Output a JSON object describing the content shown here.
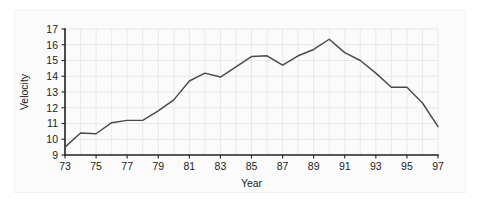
{
  "chart_data": {
    "type": "line",
    "title": "",
    "xlabel": "Year",
    "ylabel": "Velocity",
    "xlim": [
      73,
      97
    ],
    "ylim": [
      9,
      17
    ],
    "grid": true,
    "legend": false,
    "x_tick_labels": [
      "73",
      "75",
      "77",
      "79",
      "81",
      "83",
      "85",
      "87",
      "89",
      "91",
      "93",
      "95",
      "97"
    ],
    "x_tick_values": [
      73,
      75,
      77,
      79,
      81,
      83,
      85,
      87,
      89,
      91,
      93,
      95,
      97
    ],
    "y_tick_labels": [
      "9",
      "10",
      "11",
      "12",
      "13",
      "14",
      "15",
      "16",
      "17"
    ],
    "y_tick_values": [
      9,
      10,
      11,
      12,
      13,
      14,
      15,
      16,
      17
    ],
    "series": [
      {
        "name": "Velocity",
        "color": "#4a4a4a",
        "x": [
          73,
          74,
          75,
          76,
          77,
          78,
          79,
          80,
          81,
          82,
          83,
          84,
          85,
          86,
          87,
          88,
          89,
          90,
          91,
          92,
          93,
          94,
          95,
          96,
          97
        ],
        "values": [
          9.5,
          10.4,
          10.35,
          11.05,
          11.2,
          11.2,
          11.8,
          12.5,
          13.7,
          14.2,
          13.95,
          14.6,
          15.25,
          15.3,
          14.7,
          15.3,
          15.7,
          16.35,
          15.5,
          15.0,
          14.2,
          13.3,
          13.3,
          12.3,
          10.8
        ]
      }
    ]
  },
  "axes": {
    "x_axis_title": "Year",
    "y_axis_title": "Velocity"
  }
}
